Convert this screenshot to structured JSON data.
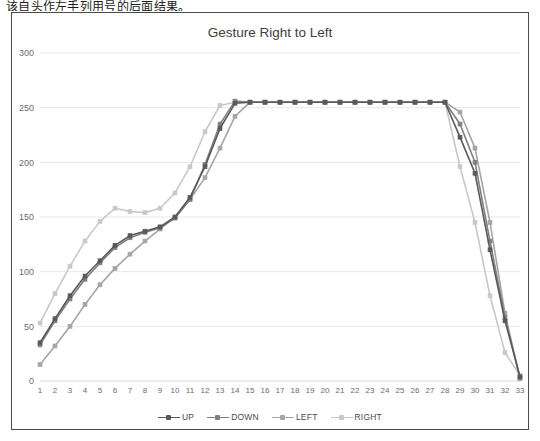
{
  "top_caption": "该自头作左手列用号的后面结果。",
  "chart_frame": {
    "title": "Gesture Right to Left"
  },
  "chart_data": {
    "type": "line",
    "title": "Gesture Right to Left",
    "xlabel": "",
    "ylabel": "",
    "ylim": [
      0,
      300
    ],
    "yticks": [
      0,
      50,
      100,
      150,
      200,
      250,
      300
    ],
    "grid": true,
    "legend_position": "bottom",
    "markers": true,
    "x": [
      1,
      2,
      3,
      4,
      5,
      6,
      7,
      8,
      9,
      10,
      11,
      12,
      13,
      14,
      15,
      16,
      17,
      18,
      19,
      20,
      21,
      22,
      23,
      24,
      25,
      26,
      27,
      28,
      29,
      30,
      31,
      32,
      33
    ],
    "categories": [
      "1",
      "2",
      "3",
      "4",
      "5",
      "6",
      "7",
      "8",
      "9",
      "10",
      "11",
      "12",
      "13",
      "14",
      "15",
      "16",
      "17",
      "18",
      "19",
      "20",
      "21",
      "22",
      "23",
      "24",
      "25",
      "26",
      "27",
      "28",
      "29",
      "30",
      "31",
      "32",
      "33"
    ],
    "series": [
      {
        "name": "UP",
        "color": "#595959",
        "values": [
          35,
          57,
          78,
          96,
          110,
          124,
          133,
          137,
          141,
          150,
          168,
          196,
          231,
          254,
          255,
          255,
          255,
          255,
          255,
          255,
          255,
          255,
          255,
          255,
          255,
          255,
          255,
          255,
          223,
          190,
          120,
          55,
          4
        ]
      },
      {
        "name": "DOWN",
        "color": "#7f7f7f",
        "values": [
          33,
          55,
          75,
          93,
          108,
          122,
          131,
          136,
          140,
          149,
          166,
          198,
          235,
          256,
          255,
          255,
          255,
          255,
          255,
          255,
          255,
          255,
          255,
          255,
          255,
          255,
          255,
          255,
          235,
          200,
          128,
          58,
          3
        ]
      },
      {
        "name": "LEFT",
        "color": "#a5a5a5",
        "values": [
          15,
          32,
          50,
          70,
          88,
          103,
          116,
          128,
          139,
          150,
          166,
          186,
          213,
          242,
          255,
          255,
          255,
          255,
          255,
          255,
          255,
          255,
          255,
          255,
          255,
          255,
          255,
          255,
          246,
          213,
          145,
          62,
          2
        ]
      },
      {
        "name": "RIGHT",
        "color": "#c8c8c8",
        "values": [
          53,
          80,
          105,
          128,
          146,
          158,
          155,
          154,
          158,
          172,
          196,
          228,
          252,
          255,
          255,
          255,
          255,
          255,
          255,
          255,
          255,
          255,
          255,
          255,
          255,
          255,
          255,
          255,
          196,
          145,
          78,
          26,
          5
        ]
      }
    ]
  },
  "legend": {
    "items": [
      {
        "label": "UP",
        "color": "#595959"
      },
      {
        "label": "DOWN",
        "color": "#7f7f7f"
      },
      {
        "label": "LEFT",
        "color": "#a5a5a5"
      },
      {
        "label": "RIGHT",
        "color": "#c8c8c8"
      }
    ]
  }
}
